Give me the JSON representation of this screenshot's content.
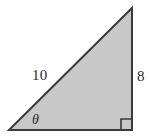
{
  "figure": {
    "type": "right-triangle-diagram",
    "background_color": "#ffffff",
    "width": 149,
    "height": 137,
    "shape": {
      "name": "right-triangle",
      "fill_color": "#c8c8c8",
      "stroke_color": "#3a3a3a",
      "stroke_width": 2,
      "vertices": {
        "left": [
          9,
          130
        ],
        "bottom_right": [
          132,
          130
        ],
        "top": [
          132,
          8
        ]
      }
    },
    "right_angle_marker": {
      "name": "right-angle-square",
      "corner": "bottom-right",
      "size": 11,
      "stroke_color": "#3a3a3a",
      "visible": true
    },
    "labels": {
      "hypotenuse": "10",
      "opposite_leg": "8",
      "angle": "θ"
    }
  },
  "chart_data": {
    "type": "diagram",
    "title": "",
    "subtitle": "",
    "xlabel": "",
    "ylabel": "",
    "annotations": [
      {
        "text": "10",
        "role": "hypotenuse-length",
        "x": 41,
        "y": 75
      },
      {
        "text": "8",
        "role": "vertical-leg-length",
        "x": 140,
        "y": 76
      },
      {
        "text": "θ",
        "role": "angle-at-left-vertex",
        "x": 37,
        "y": 120
      }
    ],
    "series": [
      {
        "name": "right-triangle",
        "values": [
          {
            "label": "hypotenuse",
            "value": 10
          },
          {
            "label": "opposite",
            "value": 8
          },
          {
            "label": "angle",
            "value": "θ"
          }
        ]
      }
    ],
    "legend": [],
    "grid": false
  }
}
